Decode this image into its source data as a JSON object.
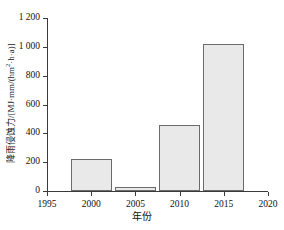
{
  "chart_data": {
    "type": "bar",
    "title": "",
    "subtitle": "",
    "xlabel": "年份",
    "ylabel": "降雨侵蚀力/[MJ·mm/(hm²·h·a)]",
    "ylabel_parts": {
      "prefix": "降雨侵蚀力/[MJ·mm/(hm",
      "superscript": "2",
      "suffix": "·h·a)]"
    },
    "categories": [
      "2000",
      "2005",
      "2010",
      "2015"
    ],
    "values": [
      225,
      30,
      460,
      1020
    ],
    "x": [
      2000,
      2005,
      2010,
      2015
    ],
    "xlim": [
      1995,
      2020
    ],
    "ylim": [
      0,
      1200
    ],
    "xticks": [
      "1995",
      "2000",
      "2005",
      "2010",
      "2015",
      "2020"
    ],
    "xtick_values": [
      1995,
      2000,
      2005,
      2010,
      2015,
      2020
    ],
    "yticks": [
      "0",
      "200",
      "400",
      "600",
      "800",
      "1 000",
      "1 200"
    ],
    "ytick_values": [
      0,
      200,
      400,
      600,
      800,
      1000,
      1200
    ],
    "grid": false,
    "legend": null,
    "bar_fill_color": "#e9e9e9",
    "bar_edge_color": "#6b6b6b",
    "axis_color": "#3a3a3a",
    "bar_width_years": 4.6
  }
}
